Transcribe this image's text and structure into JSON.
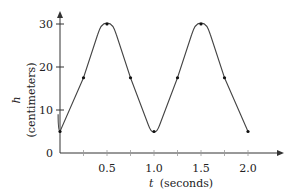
{
  "chart_data": {
    "type": "line",
    "title": "",
    "xlabel_var": "t",
    "xlabel_unit": "(seconds)",
    "ylabel_var": "h",
    "ylabel_unit": "(centimeters)",
    "xlim": [
      0,
      2.3
    ],
    "ylim": [
      0,
      33
    ],
    "grid": false,
    "x_ticks": [
      0.25,
      0.5,
      0.75,
      1.0,
      1.25,
      1.5,
      1.75,
      2.0
    ],
    "x_tick_labels": [
      {
        "value": 0.5,
        "label": "0.5"
      },
      {
        "value": 1.0,
        "label": "1.0"
      },
      {
        "value": 1.5,
        "label": "1.5"
      },
      {
        "value": 2.0,
        "label": "2.0"
      }
    ],
    "y_tick_labels": [
      {
        "value": 0,
        "label": "0"
      },
      {
        "value": 10,
        "label": "10"
      },
      {
        "value": 20,
        "label": "20"
      },
      {
        "value": 30,
        "label": "30"
      }
    ],
    "series": [
      {
        "name": "h(t)",
        "marked_points": [
          {
            "t": 0,
            "h": 5
          },
          {
            "t": 0.25,
            "h": 17.5
          },
          {
            "t": 0.5,
            "h": 30
          },
          {
            "t": 0.75,
            "h": 17.5
          },
          {
            "t": 1.0,
            "h": 5
          },
          {
            "t": 1.25,
            "h": 17.5
          },
          {
            "t": 1.5,
            "h": 30
          },
          {
            "t": 1.75,
            "h": 17.5
          },
          {
            "t": 2.0,
            "h": 5
          }
        ]
      }
    ]
  }
}
